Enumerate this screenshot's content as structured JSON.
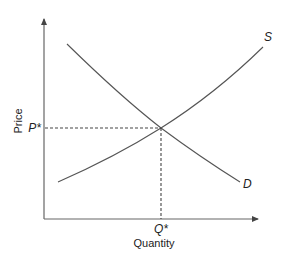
{
  "diagram": {
    "type": "supply-demand",
    "axes": {
      "x_label": "Quantity",
      "y_label": "Price"
    },
    "equilibrium": {
      "price_label": "P*",
      "quantity_label": "Q*"
    },
    "curves": [
      {
        "name": "supply",
        "label": "S"
      },
      {
        "name": "demand",
        "label": "D"
      }
    ],
    "colors": {
      "line": "#555555",
      "text": "#222222",
      "background": "#ffffff"
    }
  }
}
